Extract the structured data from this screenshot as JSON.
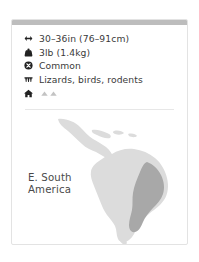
{
  "card": {
    "accent_bar_color": "#bdbdbd",
    "border_color": "#e3e3e3",
    "background_color": "#ffffff"
  },
  "facts": [
    {
      "icon": "double-arrow-horizontal-icon",
      "attribute": "length",
      "value": "30–36in (76–91cm)"
    },
    {
      "icon": "weight-icon",
      "attribute": "weight",
      "value": "3lb (1.4kg)"
    },
    {
      "icon": "circle-x-icon",
      "attribute": "conservation-status",
      "value": "Common"
    },
    {
      "icon": "teeth-icon",
      "attribute": "diet",
      "value": "Lizards, birds, rodents"
    },
    {
      "icon": "house-icon",
      "attribute": "habitat",
      "value": ""
    }
  ],
  "habitat_glyphs": [
    "hill-glyph",
    "hill-glyph"
  ],
  "map": {
    "region_label_line1": "E. South",
    "region_label_line2": "America",
    "landmass_color": "#dcdcdc",
    "highlight_color": "#a8a8a8",
    "title": "Range map — eastern South America"
  }
}
